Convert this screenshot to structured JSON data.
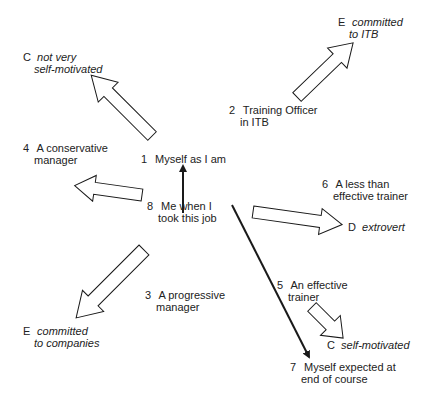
{
  "nodes": {
    "n1": {
      "num": "1",
      "line1": "Myself as I am",
      "line2": ""
    },
    "n2": {
      "num": "2",
      "line1": "Training Officer",
      "line2": "in ITB"
    },
    "n3": {
      "num": "3",
      "line1": "A progressive",
      "line2": "manager"
    },
    "n4": {
      "num": "4",
      "line1": "A conservative",
      "line2": "manager"
    },
    "n5": {
      "num": "5",
      "line1": "An effective",
      "line2": "trainer"
    },
    "n6": {
      "num": "6",
      "line1": "A less than",
      "line2": "effective trainer"
    },
    "n7": {
      "num": "7",
      "line1": "Myself expected at",
      "line2": "end of course"
    },
    "n8": {
      "num": "8",
      "line1": "Me when I",
      "line2": "took this job"
    }
  },
  "constructs": {
    "c_not_self": {
      "letter": "C",
      "line1": "not very",
      "line2": "self-motivated"
    },
    "e_itb": {
      "letter": "E",
      "line1": "committed",
      "line2": "to ITB"
    },
    "d_extrovert": {
      "letter": "D",
      "line1": "extrovert",
      "line2": ""
    },
    "e_companies": {
      "letter": "E",
      "line1": "committed",
      "line2": "to companies"
    },
    "c_self": {
      "letter": "C",
      "line1": "self-motivated",
      "line2": ""
    }
  },
  "colors": {
    "stroke": "#1a1a1a",
    "fill": "#ffffff",
    "text": "#222222"
  }
}
